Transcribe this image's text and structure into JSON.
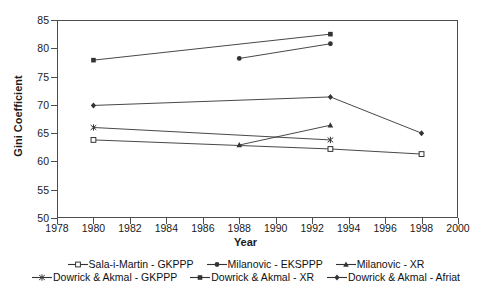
{
  "chart_data": {
    "type": "line",
    "title": "",
    "xlabel": "Year",
    "ylabel": "Gini Coefficient",
    "xlim": [
      1978,
      2000
    ],
    "ylim": [
      50,
      85
    ],
    "xticks": [
      1978,
      1980,
      1982,
      1984,
      1986,
      1988,
      1990,
      1992,
      1994,
      1996,
      1998,
      2000
    ],
    "yticks": [
      50,
      55,
      60,
      65,
      70,
      75,
      80,
      85
    ],
    "grid": false,
    "legend_position": "bottom",
    "series": [
      {
        "name": "Sala-i-Martin - GKPPP",
        "marker": "open-square",
        "x": [
          1980,
          1993,
          1998
        ],
        "y": [
          63.8,
          62.2,
          61.3
        ]
      },
      {
        "name": "Milanovic - EKSPPP",
        "marker": "filled-circle",
        "x": [
          1988,
          1993
        ],
        "y": [
          78.2,
          80.8
        ]
      },
      {
        "name": "Milanovic - XR",
        "marker": "filled-triangle",
        "x": [
          1988,
          1993
        ],
        "y": [
          62.9,
          66.4
        ]
      },
      {
        "name": "Dowrick & Akmal - GKPPP",
        "marker": "star",
        "x": [
          1980,
          1993
        ],
        "y": [
          66.0,
          63.8
        ]
      },
      {
        "name": "Dowrick & Akmal - XR",
        "marker": "filled-square",
        "x": [
          1980,
          1993
        ],
        "y": [
          77.9,
          82.5
        ]
      },
      {
        "name": "Dowrick & Akmal - Afriat",
        "marker": "filled-diamond",
        "x": [
          1980,
          1993,
          1998
        ],
        "y": [
          69.9,
          71.4,
          65.0
        ]
      }
    ]
  },
  "legend": {
    "rows": [
      [
        {
          "label": "Sala-i-Martin - GKPPP",
          "marker": "open-square"
        },
        {
          "label": "Milanovic - EKSPPP",
          "marker": "filled-circle"
        },
        {
          "label": "Milanovic - XR",
          "marker": "filled-triangle"
        }
      ],
      [
        {
          "label": "Dowrick & Akmal - GKPPP",
          "marker": "star"
        },
        {
          "label": "Dowrick & Akmal - XR",
          "marker": "filled-square"
        },
        {
          "label": "Dowrick & Akmal - Afriat",
          "marker": "filled-diamond"
        }
      ]
    ]
  },
  "colors": {
    "axis": "#4d4d4d",
    "series": "#333333",
    "background": "#ffffff",
    "text": "#1a1a1a"
  }
}
